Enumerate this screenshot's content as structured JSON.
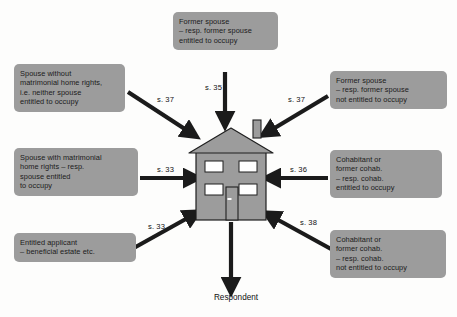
{
  "diagram": {
    "center": {
      "icon": "house-icon",
      "label": "house"
    },
    "sink": {
      "label": "Respondent"
    },
    "colors": {
      "background": "#fdfdfc",
      "box_fill": "#9c9c9c",
      "box_text": "#1b1b1b",
      "house_fill": "#9c9c9c",
      "house_outline": "#1f1f1f",
      "window_fill": "#ffffff",
      "arrow": "#1b1b1b"
    },
    "nodes": [
      {
        "id": "top",
        "position": "top",
        "lines": [
          "Former spouse",
          "– resp. former spouse",
          "entitled to occupy"
        ]
      },
      {
        "id": "top-left",
        "position": "top-left",
        "lines": [
          "Spouse without",
          "matrimonial home rights,",
          "i.e. neither spouse",
          "entitled to occupy"
        ]
      },
      {
        "id": "top-right",
        "position": "top-right",
        "lines": [
          "Former spouse",
          "– resp. former spouse",
          "not entitled to occupy"
        ]
      },
      {
        "id": "mid-left",
        "position": "middle-left",
        "lines": [
          "Spouse with matrimonial",
          "home rights – resp.",
          "spouse entitled",
          "to occupy"
        ]
      },
      {
        "id": "mid-right",
        "position": "middle-right",
        "lines": [
          "Cohabitant or",
          "former cohab.",
          "– resp. cohab.",
          "entitled to occupy"
        ]
      },
      {
        "id": "bottom-left",
        "position": "bottom-left",
        "lines": [
          "Entitled applicant",
          "– beneficial estate etc."
        ]
      },
      {
        "id": "bottom-right",
        "position": "bottom-right",
        "lines": [
          "Cohabitant or",
          "former cohab.",
          "– resp. cohab.",
          "not entitled to occupy"
        ]
      }
    ],
    "edges": [
      {
        "id": "s35",
        "label": "s. 35",
        "from": "top",
        "to": "house",
        "direction": "down"
      },
      {
        "id": "s37-left",
        "label": "s. 37",
        "from": "top-left",
        "to": "house",
        "direction": "down-right"
      },
      {
        "id": "s37-right",
        "label": "s. 37",
        "from": "top-right",
        "to": "house",
        "direction": "down-left"
      },
      {
        "id": "s33-mid",
        "label": "s. 33",
        "from": "mid-left",
        "to": "house",
        "direction": "right"
      },
      {
        "id": "s36",
        "label": "s. 36",
        "from": "mid-right",
        "to": "house",
        "direction": "left"
      },
      {
        "id": "s33-bottom",
        "label": "s. 33",
        "from": "bottom-left",
        "to": "house",
        "direction": "up-right"
      },
      {
        "id": "s38",
        "label": "s. 38",
        "from": "bottom-right",
        "to": "house",
        "direction": "up-left"
      },
      {
        "id": "respondent",
        "label": "",
        "from": "house",
        "to": "Respondent",
        "direction": "down"
      }
    ]
  }
}
